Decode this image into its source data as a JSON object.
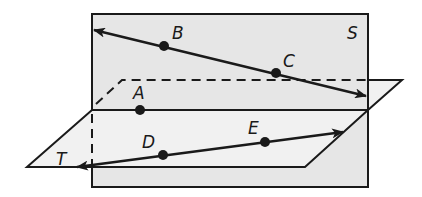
{
  "diagram": {
    "colors": {
      "plane_s_fill": "#e6e6e6",
      "plane_t_fill": "#f1f1f1",
      "stroke": "#1a1a1a"
    },
    "planes": [
      {
        "name": "S",
        "label": "S"
      },
      {
        "name": "T",
        "label": "T"
      }
    ],
    "points": [
      {
        "name": "A",
        "label": "A",
        "x": 140,
        "y": 110
      },
      {
        "name": "B",
        "label": "B",
        "x": 164,
        "y": 46
      },
      {
        "name": "C",
        "label": "C",
        "x": 276,
        "y": 73
      },
      {
        "name": "D",
        "label": "D",
        "x": 163,
        "y": 155
      },
      {
        "name": "E",
        "label": "E",
        "x": 265,
        "y": 142
      }
    ],
    "lines": [
      {
        "name": "BC",
        "through": [
          "B",
          "C"
        ],
        "plane": "S"
      },
      {
        "name": "DE",
        "through": [
          "D",
          "E"
        ],
        "plane": "T"
      }
    ],
    "intersection": "line through A (intersection of S and T)"
  }
}
